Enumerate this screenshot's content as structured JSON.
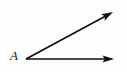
{
  "figure": {
    "kind": "geometry-angle-diagram",
    "width": 127,
    "height": 72,
    "background_color": "#fdfdfd",
    "stroke_color": "#0d0d0d",
    "label_color": "#111111",
    "vertex_label": "A",
    "vertex": {
      "x": 26,
      "y": 59
    },
    "rays": [
      {
        "name": "horizontal-ray",
        "from": {
          "x": 26,
          "y": 59
        },
        "to": {
          "x": 114,
          "y": 59
        },
        "arrowhead": "filled-triangle"
      },
      {
        "name": "diagonal-ray",
        "from": {
          "x": 26,
          "y": 59
        },
        "to": {
          "x": 113,
          "y": 12
        },
        "arrowhead": "filled-triangle"
      }
    ]
  }
}
